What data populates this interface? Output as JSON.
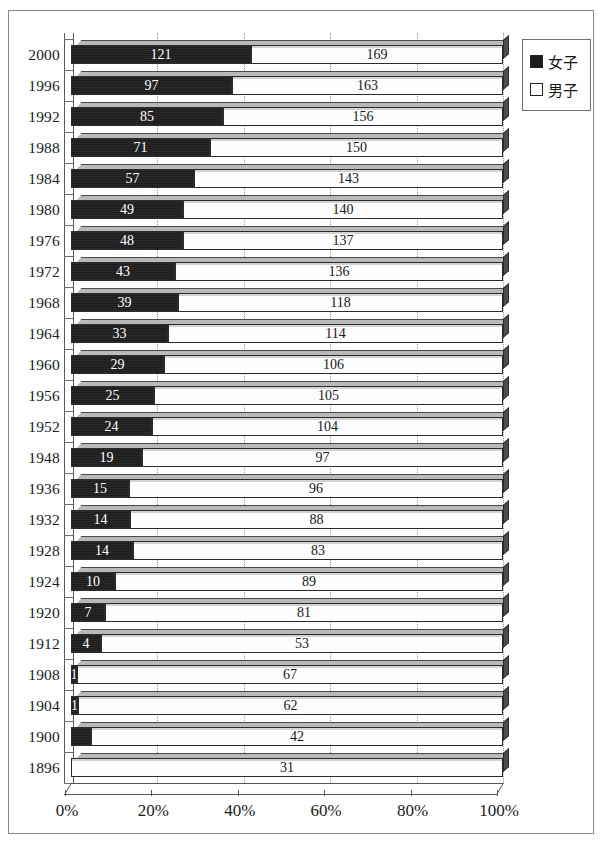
{
  "chart_data": {
    "type": "bar",
    "subtype": "stacked-horizontal-100-percent-3d",
    "title": "",
    "xlabel": "",
    "ylabel": "",
    "xlim": [
      0,
      100
    ],
    "xticks": [
      "0%",
      "20%",
      "40%",
      "60%",
      "80%",
      "100%"
    ],
    "xtick_values": [
      0,
      20,
      40,
      60,
      80,
      100
    ],
    "grid": true,
    "grid_axis": "x",
    "legend_position": "top-right",
    "categories": [
      "2000",
      "1996",
      "1992",
      "1988",
      "1984",
      "1980",
      "1976",
      "1972",
      "1968",
      "1964",
      "1960",
      "1956",
      "1952",
      "1948",
      "1936",
      "1932",
      "1928",
      "1924",
      "1920",
      "1912",
      "1908",
      "1904",
      "1900",
      "1896"
    ],
    "series": [
      {
        "name": "女子",
        "color": "#1d1d1d",
        "values": [
          121,
          97,
          85,
          71,
          57,
          49,
          48,
          43,
          39,
          33,
          29,
          25,
          24,
          19,
          15,
          14,
          14,
          10,
          7,
          4,
          1,
          1,
          2,
          0
        ]
      },
      {
        "name": "男子",
        "color": "#ffffff",
        "values": [
          169,
          163,
          156,
          150,
          143,
          140,
          137,
          136,
          118,
          114,
          106,
          105,
          104,
          97,
          96,
          88,
          83,
          89,
          81,
          53,
          67,
          62,
          42,
          31
        ]
      }
    ],
    "rows": [
      {
        "year": "2000",
        "female": 121,
        "male": 169,
        "female_label": "121",
        "male_label": "169",
        "female_label_visible": true
      },
      {
        "year": "1996",
        "female": 97,
        "male": 163,
        "female_label": "97",
        "male_label": "163",
        "female_label_visible": true
      },
      {
        "year": "1992",
        "female": 85,
        "male": 156,
        "female_label": "85",
        "male_label": "156",
        "female_label_visible": true
      },
      {
        "year": "1988",
        "female": 71,
        "male": 150,
        "female_label": "71",
        "male_label": "150",
        "female_label_visible": true
      },
      {
        "year": "1984",
        "female": 57,
        "male": 143,
        "female_label": "57",
        "male_label": "143",
        "female_label_visible": true
      },
      {
        "year": "1980",
        "female": 49,
        "male": 140,
        "female_label": "49",
        "male_label": "140",
        "female_label_visible": true
      },
      {
        "year": "1976",
        "female": 48,
        "male": 137,
        "female_label": "48",
        "male_label": "137",
        "female_label_visible": true
      },
      {
        "year": "1972",
        "female": 43,
        "male": 136,
        "female_label": "43",
        "male_label": "136",
        "female_label_visible": true
      },
      {
        "year": "1968",
        "female": 39,
        "male": 118,
        "female_label": "39",
        "male_label": "118",
        "female_label_visible": true
      },
      {
        "year": "1964",
        "female": 33,
        "male": 114,
        "female_label": "33",
        "male_label": "114",
        "female_label_visible": true
      },
      {
        "year": "1960",
        "female": 29,
        "male": 106,
        "female_label": "29",
        "male_label": "106",
        "female_label_visible": true
      },
      {
        "year": "1956",
        "female": 25,
        "male": 105,
        "female_label": "25",
        "male_label": "105",
        "female_label_visible": true
      },
      {
        "year": "1952",
        "female": 24,
        "male": 104,
        "female_label": "24",
        "male_label": "104",
        "female_label_visible": true
      },
      {
        "year": "1948",
        "female": 19,
        "male": 97,
        "female_label": "19",
        "male_label": "97",
        "female_label_visible": true
      },
      {
        "year": "1936",
        "female": 15,
        "male": 96,
        "female_label": "15",
        "male_label": "96",
        "female_label_visible": true
      },
      {
        "year": "1932",
        "female": 14,
        "male": 88,
        "female_label": "14",
        "male_label": "88",
        "female_label_visible": true
      },
      {
        "year": "1928",
        "female": 14,
        "male": 83,
        "female_label": "14",
        "male_label": "83",
        "female_label_visible": true
      },
      {
        "year": "1924",
        "female": 10,
        "male": 89,
        "female_label": "10",
        "male_label": "89",
        "female_label_visible": true
      },
      {
        "year": "1920",
        "female": 7,
        "male": 81,
        "female_label": "7",
        "male_label": "81",
        "female_label_visible": true
      },
      {
        "year": "1912",
        "female": 4,
        "male": 53,
        "female_label": "4",
        "male_label": "53",
        "female_label_visible": true
      },
      {
        "year": "1908",
        "female": 1,
        "male": 67,
        "female_label": "1",
        "male_label": "67",
        "female_label_visible": true
      },
      {
        "year": "1904",
        "female": 1,
        "male": 62,
        "female_label": "1",
        "male_label": "62",
        "female_label_visible": true
      },
      {
        "year": "1900",
        "female": 2,
        "male": 42,
        "female_label": "",
        "male_label": "42",
        "female_label_visible": false
      },
      {
        "year": "1896",
        "female": 0,
        "male": 31,
        "female_label": "0",
        "male_label": "31",
        "female_label_visible": true
      }
    ]
  },
  "legend": {
    "items": [
      {
        "label": "女子",
        "swatch": "filled-black-square",
        "color": "#1d1d1d"
      },
      {
        "label": "男子",
        "swatch": "empty-white-square",
        "color": "#ffffff"
      }
    ]
  },
  "axes": {
    "x_tick_labels": [
      "0%",
      "20%",
      "40%",
      "60%",
      "80%",
      "100%"
    ],
    "y_tick_labels": [
      "2000",
      "1996",
      "1992",
      "1988",
      "1984",
      "1980",
      "1976",
      "1972",
      "1968",
      "1964",
      "1960",
      "1956",
      "1952",
      "1948",
      "1936",
      "1932",
      "1928",
      "1924",
      "1920",
      "1912",
      "1908",
      "1904",
      "1900",
      "1896"
    ]
  },
  "colors": {
    "female_bar": "#1d1d1d",
    "male_bar": "#ffffff",
    "frame": "#8a8a8a",
    "gridline": "#9a9a9a",
    "axis": "#555555",
    "text": "#1c1c1c"
  }
}
